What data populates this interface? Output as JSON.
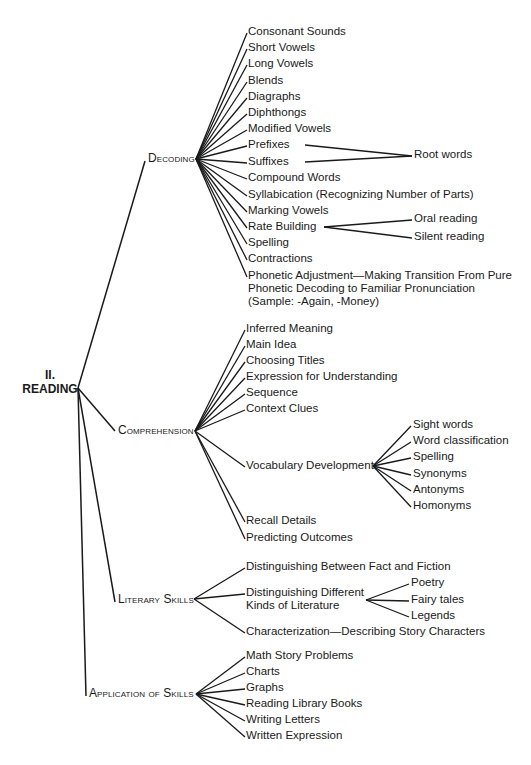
{
  "diagram": {
    "line_color": "#1a1a1a",
    "root": {
      "number": "II.",
      "label": "READING",
      "x": 72,
      "y": 388
    },
    "categories": [
      {
        "label": "Decoding",
        "x": 148,
        "y": 159,
        "jx": 196,
        "jy": 159,
        "items": [
          {
            "label": "Consonant Sounds",
            "x": 248,
            "y": 32
          },
          {
            "label": "Short Vowels",
            "x": 248,
            "y": 48
          },
          {
            "label": "Long Vowels",
            "x": 248,
            "y": 64
          },
          {
            "label": "Blends",
            "x": 248,
            "y": 81
          },
          {
            "label": "Diagraphs",
            "x": 248,
            "y": 97
          },
          {
            "label": "Diphthongs",
            "x": 248,
            "y": 113
          },
          {
            "label": "Modified Vowels",
            "x": 248,
            "y": 129
          },
          {
            "label": "Prefixes",
            "x": 248,
            "y": 145
          },
          {
            "label": "Suffixes",
            "x": 248,
            "y": 162
          },
          {
            "label": "Compound Words",
            "x": 248,
            "y": 178
          },
          {
            "label": "Syllabication (Recognizing Number of Parts)",
            "x": 248,
            "y": 195
          },
          {
            "label": "Marking Vowels",
            "x": 248,
            "y": 211
          },
          {
            "label": "Rate Building",
            "x": 248,
            "y": 227
          },
          {
            "label": "Spelling",
            "x": 248,
            "y": 243
          },
          {
            "label": "Contractions",
            "x": 248,
            "y": 259
          },
          {
            "label": "Phonetic Adjustment—Making Transition From Pure\nPhonetic Decoding to Familiar Pronunciation\n(Sample: -Again, -Money)",
            "x": 248,
            "y": 276
          }
        ],
        "sub": [
          {
            "label": "Root words",
            "x": 414,
            "y": 155,
            "from": [
              [
                305,
                145
              ],
              [
                305,
                162
              ]
            ]
          },
          {
            "label": "Oral reading",
            "x": 414,
            "y": 219,
            "from": [
              [
                324,
                227
              ]
            ]
          },
          {
            "label": "Silent reading",
            "x": 414,
            "y": 237,
            "from": [
              [
                324,
                227
              ]
            ]
          }
        ]
      },
      {
        "label": "Comprehension",
        "x": 118,
        "y": 431,
        "jx": 195,
        "jy": 431,
        "items": [
          {
            "label": "Inferred Meaning",
            "x": 246,
            "y": 329
          },
          {
            "label": "Main Idea",
            "x": 246,
            "y": 345
          },
          {
            "label": "Choosing Titles",
            "x": 246,
            "y": 361
          },
          {
            "label": "Expression for Understanding",
            "x": 246,
            "y": 377
          },
          {
            "label": "Sequence",
            "x": 246,
            "y": 393
          },
          {
            "label": "Context Clues",
            "x": 246,
            "y": 409
          },
          {
            "label": "Vocabulary Development",
            "x": 246,
            "y": 466
          },
          {
            "label": "Recall Details",
            "x": 246,
            "y": 521
          },
          {
            "label": "Predicting Outcomes",
            "x": 246,
            "y": 538
          }
        ],
        "sub_hub": {
          "x": 373,
          "y": 466
        },
        "sub": [
          {
            "label": "Sight words",
            "x": 413,
            "y": 425
          },
          {
            "label": "Word classification",
            "x": 413,
            "y": 441
          },
          {
            "label": "Spelling",
            "x": 413,
            "y": 457
          },
          {
            "label": "Synonyms",
            "x": 413,
            "y": 474
          },
          {
            "label": "Antonyms",
            "x": 413,
            "y": 490
          },
          {
            "label": "Homonyms",
            "x": 413,
            "y": 506
          }
        ]
      },
      {
        "label": "Literary Skills",
        "x": 118,
        "y": 600,
        "jx": 194,
        "jy": 599,
        "items": [
          {
            "label": "Distinguishing Between Fact and Fiction",
            "x": 246,
            "y": 567
          },
          {
            "label": "Distinguishing Different\nKinds of Literature",
            "x": 246,
            "y": 593
          },
          {
            "label": "Characterization—Describing Story Characters",
            "x": 246,
            "y": 632
          }
        ],
        "sub_hub": {
          "x": 366,
          "y": 600
        },
        "sub": [
          {
            "label": "Poetry",
            "x": 411,
            "y": 583
          },
          {
            "label": "Fairy tales",
            "x": 411,
            "y": 600
          },
          {
            "label": "Legends",
            "x": 411,
            "y": 616
          }
        ]
      },
      {
        "label": "Application of Skills",
        "x": 89,
        "y": 694,
        "jx": 196,
        "jy": 694,
        "items": [
          {
            "label": "Math Story Problems",
            "x": 246,
            "y": 656
          },
          {
            "label": "Charts",
            "x": 246,
            "y": 672
          },
          {
            "label": "Graphs",
            "x": 246,
            "y": 688
          },
          {
            "label": "Reading Library Books",
            "x": 246,
            "y": 704
          },
          {
            "label": "Writing Letters",
            "x": 246,
            "y": 720
          },
          {
            "label": "Written Expression",
            "x": 246,
            "y": 736
          }
        ]
      }
    ]
  }
}
